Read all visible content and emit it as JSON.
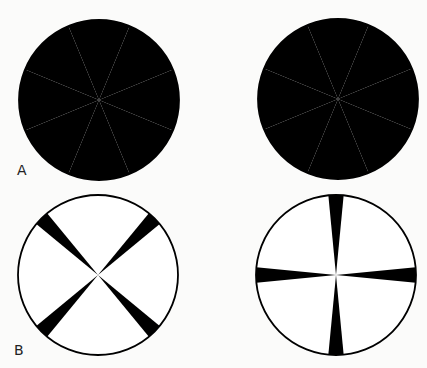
{
  "figure": {
    "panels": [
      {
        "label": "A",
        "label_pos": [
          17,
          162
        ],
        "disks": [
          {
            "cx": 99,
            "cy": 100,
            "r": 80,
            "sectors": 8,
            "black_offset_deg": 45,
            "black_width_deg": 45
          },
          {
            "cx": 338,
            "cy": 99,
            "r": 80,
            "sectors": 8,
            "black_offset_deg": 0,
            "black_width_deg": 45
          }
        ]
      },
      {
        "label": "B",
        "label_pos": [
          14,
          342
        ],
        "disks": [
          {
            "cx": 98,
            "cy": 275,
            "r": 80,
            "sectors": 4,
            "black_offset_deg": 45,
            "black_width_deg": 11
          },
          {
            "cx": 336,
            "cy": 275,
            "r": 80,
            "sectors": 4,
            "black_offset_deg": 0,
            "black_width_deg": 11
          }
        ]
      }
    ],
    "colors": {
      "black": "#000000",
      "white": "#ffffff",
      "background": "#fbfbfa"
    }
  }
}
